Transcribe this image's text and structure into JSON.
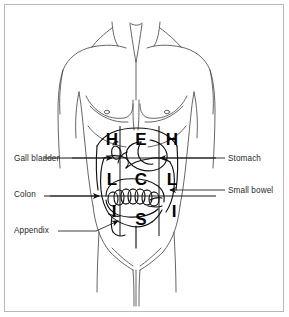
{
  "figure": {
    "frame_color": "#b9b9b9",
    "background_color": "#ffffff",
    "line_color": "#1a1a1a",
    "label_color": "#2b2b2b"
  },
  "labels": {
    "left": [
      {
        "id": "gall-bladder",
        "text": "Gall bladder"
      },
      {
        "id": "colon",
        "text": "Colon"
      },
      {
        "id": "appendix",
        "text": "Appendix"
      }
    ],
    "right": [
      {
        "id": "stomach",
        "text": "Stomach"
      },
      {
        "id": "small-bowel",
        "text": "Small bowel"
      }
    ]
  },
  "region_grid": {
    "rows": 3,
    "cols": 3,
    "letters": [
      [
        "H",
        "E",
        "H"
      ],
      [
        "L",
        "C",
        "L"
      ],
      [
        "I",
        "S",
        "I"
      ]
    ],
    "cells": [
      {
        "id": "r1c1",
        "letter": "H",
        "x": 104,
        "y": 131
      },
      {
        "id": "r1c2",
        "letter": "E",
        "x": 133,
        "y": 131
      },
      {
        "id": "r1c3",
        "letter": "H",
        "x": 164,
        "y": 131
      },
      {
        "id": "r2c1",
        "letter": "L",
        "x": 104,
        "y": 171
      },
      {
        "id": "r2c2",
        "letter": "C",
        "x": 133,
        "y": 171
      },
      {
        "id": "r2c3",
        "letter": "L",
        "x": 164,
        "y": 171
      },
      {
        "id": "r3c1",
        "letter": "I",
        "x": 106,
        "y": 203
      },
      {
        "id": "r3c2",
        "letter": "S",
        "x": 133,
        "y": 211
      },
      {
        "id": "r3c3",
        "letter": "I",
        "x": 166,
        "y": 203
      }
    ]
  },
  "anatomy": {
    "figure_type": "anterior torso outline",
    "drawn_structures": [
      "neck",
      "clavicles",
      "shoulders",
      "pectoral-outline",
      "nipples",
      "costal-margin",
      "stomach",
      "gall-bladder",
      "colon",
      "small-bowel-loops",
      "appendix",
      "groin",
      "hips"
    ]
  }
}
